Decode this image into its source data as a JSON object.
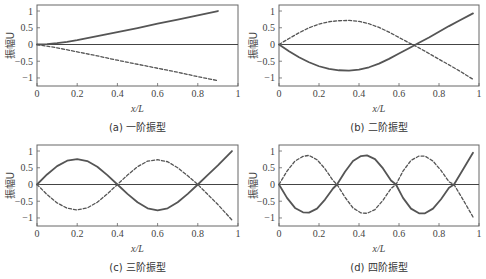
{
  "figure": {
    "panels": [
      {
        "id": "a",
        "caption": "(a)  一阶振型"
      },
      {
        "id": "b",
        "caption": "(b)  二阶振型"
      },
      {
        "id": "c",
        "caption": "(c)  三阶振型"
      },
      {
        "id": "d",
        "caption": "(d)  四阶振型"
      }
    ],
    "colors": {
      "solid": "#555555",
      "dashed": "#555555",
      "zero_line": "#444444",
      "frame": "#666666"
    }
  },
  "chart_data": [
    {
      "type": "line",
      "title": "(a) 一阶振型",
      "xlabel": "x/L",
      "ylabel": "振幅U",
      "xlim": [
        0,
        1
      ],
      "ylim": [
        -1.24,
        1.18
      ],
      "xticks": [
        0,
        0.2,
        0.4,
        0.6,
        0.8,
        1
      ],
      "xtick_labels": [
        "0",
        "0.2",
        "0.4",
        "0.6",
        "0.8",
        "1"
      ],
      "yticks": [
        1,
        0.5,
        0,
        -0.5,
        -1
      ],
      "ytick_labels": [
        "1",
        "0.5",
        "0",
        "−0.5",
        "−1"
      ],
      "grid": false,
      "zero_line": true,
      "series": [
        {
          "name": "solid",
          "style": "solid",
          "x": [
            0,
            0.05,
            0.1,
            0.15,
            0.2,
            0.3,
            0.4,
            0.5,
            0.6,
            0.7,
            0.8,
            0.9
          ],
          "values": [
            0,
            0.01,
            0.04,
            0.08,
            0.13,
            0.25,
            0.37,
            0.49,
            0.62,
            0.74,
            0.87,
            1.0
          ]
        },
        {
          "name": "dashed",
          "style": "dashed",
          "x": [
            0,
            0.1,
            0.2,
            0.3,
            0.4,
            0.5,
            0.6,
            0.7,
            0.8,
            0.9
          ],
          "values": [
            0,
            -0.1,
            -0.22,
            -0.34,
            -0.47,
            -0.59,
            -0.71,
            -0.83,
            -0.96,
            -1.08
          ]
        }
      ]
    },
    {
      "type": "line",
      "title": "(b) 二阶振型",
      "xlabel": "x/L",
      "ylabel": "振幅U",
      "xlim": [
        0,
        1
      ],
      "ylim": [
        -1.24,
        1.18
      ],
      "xticks": [
        0,
        0.2,
        0.4,
        0.6,
        0.8,
        1
      ],
      "xtick_labels": [
        "0",
        "0.2",
        "0.4",
        "0.6",
        "0.8",
        "1"
      ],
      "yticks": [
        1,
        0.5,
        0,
        -0.5,
        -1
      ],
      "ytick_labels": [
        "1",
        "0.5",
        "0",
        "−0.5",
        "−1"
      ],
      "grid": false,
      "zero_line": true,
      "series": [
        {
          "name": "solid",
          "style": "solid",
          "x": [
            0,
            0.05,
            0.1,
            0.15,
            0.2,
            0.25,
            0.3,
            0.35,
            0.4,
            0.45,
            0.5,
            0.55,
            0.6,
            0.65,
            0.7,
            0.75,
            0.8,
            0.85,
            0.9,
            0.97
          ],
          "values": [
            0,
            -0.2,
            -0.38,
            -0.53,
            -0.65,
            -0.73,
            -0.77,
            -0.78,
            -0.75,
            -0.68,
            -0.57,
            -0.43,
            -0.27,
            -0.11,
            0.05,
            0.21,
            0.38,
            0.55,
            0.71,
            0.93
          ]
        },
        {
          "name": "dashed",
          "style": "dashed",
          "x": [
            0,
            0.05,
            0.1,
            0.15,
            0.2,
            0.25,
            0.3,
            0.35,
            0.4,
            0.45,
            0.5,
            0.55,
            0.6,
            0.65,
            0.7,
            0.75,
            0.8,
            0.85,
            0.9,
            0.97
          ],
          "values": [
            0,
            0.18,
            0.35,
            0.5,
            0.61,
            0.68,
            0.71,
            0.72,
            0.69,
            0.62,
            0.51,
            0.37,
            0.21,
            0.05,
            -0.1,
            -0.27,
            -0.44,
            -0.61,
            -0.78,
            -1.04
          ]
        }
      ]
    },
    {
      "type": "line",
      "title": "(c) 三阶振型",
      "xlabel": "x/L",
      "ylabel": "振幅U",
      "xlim": [
        0,
        1
      ],
      "ylim": [
        -1.24,
        1.18
      ],
      "xticks": [
        0,
        0.2,
        0.4,
        0.6,
        0.8,
        1
      ],
      "xtick_labels": [
        "0",
        "0.2",
        "0.4",
        "0.6",
        "0.8",
        "1"
      ],
      "yticks": [
        1,
        0.5,
        0,
        -0.5,
        -1
      ],
      "ytick_labels": [
        "1",
        "0.5",
        "0",
        "−0.5",
        "−1"
      ],
      "grid": false,
      "zero_line": true,
      "series": [
        {
          "name": "solid",
          "style": "solid",
          "x": [
            0,
            0.05,
            0.1,
            0.15,
            0.2,
            0.25,
            0.3,
            0.35,
            0.4,
            0.45,
            0.5,
            0.55,
            0.6,
            0.65,
            0.7,
            0.75,
            0.8,
            0.85,
            0.9,
            0.97
          ],
          "values": [
            0,
            0.3,
            0.55,
            0.71,
            0.76,
            0.7,
            0.53,
            0.28,
            0.0,
            -0.28,
            -0.53,
            -0.71,
            -0.77,
            -0.71,
            -0.53,
            -0.28,
            0.0,
            0.29,
            0.57,
            1.0
          ]
        },
        {
          "name": "dashed",
          "style": "dashed",
          "x": [
            0,
            0.05,
            0.1,
            0.15,
            0.2,
            0.25,
            0.3,
            0.35,
            0.4,
            0.45,
            0.5,
            0.55,
            0.6,
            0.65,
            0.7,
            0.75,
            0.8,
            0.85,
            0.9,
            0.97
          ],
          "values": [
            0,
            -0.3,
            -0.55,
            -0.71,
            -0.76,
            -0.7,
            -0.53,
            -0.28,
            0.0,
            0.28,
            0.53,
            0.7,
            0.74,
            0.68,
            0.5,
            0.26,
            0.0,
            -0.3,
            -0.6,
            -1.06
          ]
        }
      ]
    },
    {
      "type": "line",
      "title": "(d) 四阶振型",
      "xlabel": "x/L",
      "ylabel": "振幅U",
      "xlim": [
        0,
        1
      ],
      "ylim": [
        -1.24,
        1.18
      ],
      "xticks": [
        0,
        0.2,
        0.4,
        0.6,
        0.8,
        1
      ],
      "xtick_labels": [
        "0",
        "0.2",
        "0.4",
        "0.6",
        "0.8",
        "1"
      ],
      "yticks": [
        1,
        0.5,
        0,
        -0.5,
        -1
      ],
      "ytick_labels": [
        "1",
        "0.5",
        "0",
        "−0.5",
        "−1"
      ],
      "grid": false,
      "zero_line": true,
      "series": [
        {
          "name": "solid",
          "style": "solid",
          "x": [
            0,
            0.04,
            0.08,
            0.12,
            0.15,
            0.19,
            0.23,
            0.27,
            0.29,
            0.33,
            0.37,
            0.41,
            0.44,
            0.48,
            0.52,
            0.56,
            0.585,
            0.62,
            0.66,
            0.7,
            0.73,
            0.77,
            0.81,
            0.85,
            0.875,
            0.92,
            0.97
          ],
          "values": [
            0,
            -0.4,
            -0.7,
            -0.83,
            -0.84,
            -0.72,
            -0.45,
            -0.12,
            0.0,
            0.38,
            0.7,
            0.85,
            0.87,
            0.76,
            0.48,
            0.12,
            0.0,
            -0.4,
            -0.72,
            -0.86,
            -0.86,
            -0.72,
            -0.44,
            -0.1,
            0.0,
            0.45,
            0.95
          ]
        },
        {
          "name": "dashed",
          "style": "dashed",
          "x": [
            0,
            0.04,
            0.08,
            0.12,
            0.15,
            0.19,
            0.23,
            0.27,
            0.29,
            0.33,
            0.37,
            0.41,
            0.44,
            0.48,
            0.52,
            0.56,
            0.585,
            0.62,
            0.66,
            0.7,
            0.73,
            0.77,
            0.81,
            0.85,
            0.875,
            0.92,
            0.97
          ],
          "values": [
            0,
            0.4,
            0.7,
            0.84,
            0.87,
            0.74,
            0.47,
            0.12,
            0.0,
            -0.38,
            -0.7,
            -0.85,
            -0.86,
            -0.75,
            -0.47,
            -0.12,
            0.0,
            0.4,
            0.72,
            0.85,
            0.85,
            0.7,
            0.42,
            0.08,
            0.0,
            -0.45,
            -0.97
          ]
        }
      ]
    }
  ]
}
